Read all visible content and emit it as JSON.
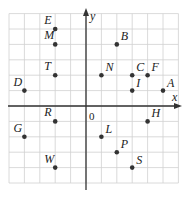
{
  "chart_data": {
    "type": "scatter",
    "title": "",
    "xlabel": "x",
    "ylabel": "y",
    "origin_label": "0",
    "grid": true,
    "xlim": [
      -5,
      6
    ],
    "ylim": [
      -5,
      6
    ],
    "points": [
      {
        "label": "E",
        "x": -2,
        "y": 5
      },
      {
        "label": "M",
        "x": -2,
        "y": 4
      },
      {
        "label": "T",
        "x": -2,
        "y": 2
      },
      {
        "label": "D",
        "x": -4,
        "y": 1
      },
      {
        "label": "B",
        "x": 2,
        "y": 4
      },
      {
        "label": "N",
        "x": 1,
        "y": 2
      },
      {
        "label": "C",
        "x": 3,
        "y": 2
      },
      {
        "label": "F",
        "x": 4,
        "y": 2
      },
      {
        "label": "I",
        "x": 3,
        "y": 1
      },
      {
        "label": "A",
        "x": 5,
        "y": 1
      },
      {
        "label": "R",
        "x": -2,
        "y": -1
      },
      {
        "label": "G",
        "x": -4,
        "y": -2
      },
      {
        "label": "W",
        "x": -2,
        "y": -4
      },
      {
        "label": "H",
        "x": 4,
        "y": -1
      },
      {
        "label": "L",
        "x": 1,
        "y": -2
      },
      {
        "label": "P",
        "x": 2,
        "y": -3
      },
      {
        "label": "S",
        "x": 3,
        "y": -4
      }
    ]
  },
  "colors": {
    "grid": "#d0d0d0",
    "axis": "#333333",
    "point": "#333333"
  }
}
